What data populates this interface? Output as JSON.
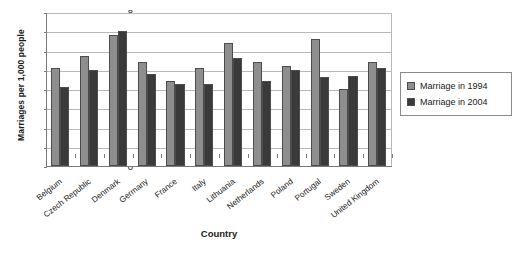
{
  "chart_data": {
    "type": "bar",
    "title": "",
    "xlabel": "Country",
    "ylabel": "Marriages  per 1,000 people",
    "ylim": [
      0,
      8
    ],
    "yticks": [
      0,
      1,
      2,
      3,
      4,
      5,
      6,
      7,
      8
    ],
    "grid": true,
    "legend_position": "right",
    "categories": [
      "Belgium",
      "Czech Republic",
      "Denmark",
      "Germany",
      "France",
      "Italy",
      "Lithuania",
      "Netherlands",
      "Poland",
      "Portugal",
      "Sweden",
      "United Kingdom"
    ],
    "series": [
      {
        "name": "Marriage in 1994",
        "color": "#8e8e8e",
        "values": [
          5.1,
          5.7,
          6.8,
          5.4,
          4.4,
          5.1,
          6.4,
          5.4,
          5.2,
          6.6,
          4.0,
          5.4
        ]
      },
      {
        "name": "Marriage in 2004",
        "color": "#3a3a3a",
        "values": [
          4.1,
          5.0,
          7.0,
          4.8,
          4.25,
          4.25,
          5.6,
          4.4,
          5.0,
          4.6,
          4.7,
          5.1
        ]
      }
    ]
  },
  "caption": ""
}
